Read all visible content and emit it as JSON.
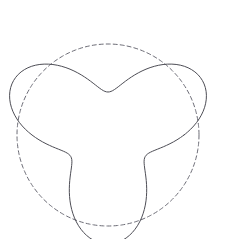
{
  "figure": {
    "title": "",
    "width": 235,
    "height": 239,
    "background_color": "#ffffff"
  },
  "chart_data": {
    "type": "line",
    "title": "",
    "subtitle": "",
    "xlabel": "",
    "ylabel": "",
    "xlim": [
      0,
      235
    ],
    "ylim": [
      0,
      239
    ],
    "grid": false,
    "axes_visible": false,
    "ticks_visible": false,
    "legend": {
      "visible": false,
      "position": "none",
      "entries": []
    },
    "annotations": [],
    "coordinate_system": "polar-on-pixel-canvas",
    "center": {
      "x": 108,
      "y": 135
    },
    "series": [
      {
        "name": "trefoil-curve",
        "style": "solid",
        "color": "#4d4d55",
        "line_width": 1.0,
        "closed": true,
        "equation": "r(theta) = 76 + 33*cos(3*theta + 1.5708)",
        "polar": {
          "mean_radius": 76,
          "amplitude": 33,
          "lobes": 3,
          "phase_degrees": 90,
          "min_radius": 43,
          "max_radius": 109
        },
        "extrema": {
          "lobe_peaks": [
            {
              "label": "top-lobe",
              "x": 93,
              "y": 12
            },
            {
              "label": "right-lobe",
              "x": 222,
              "y": 148
            },
            {
              "label": "left-lobe",
              "x": 8,
              "y": 190
            }
          ],
          "valleys": [
            {
              "label": "upper-left-notch",
              "x": 52,
              "y": 95
            },
            {
              "label": "upper-right-notch",
              "x": 163,
              "y": 98
            },
            {
              "label": "bottom-notch",
              "x": 120,
              "y": 188
            }
          ]
        }
      },
      {
        "name": "reference-circle",
        "style": "dashed",
        "color": "#6b6b75",
        "line_width": 1.0,
        "closed": true,
        "dash_pattern": [
          4,
          3
        ],
        "equation": "r(theta) = 91",
        "circle": {
          "center_x": 108,
          "center_y": 135,
          "radius": 91,
          "leftmost_x": 17,
          "rightmost_x": 199,
          "topmost_y": 44,
          "bottommost_y": 226
        }
      }
    ],
    "intersections": [
      {
        "x": 20,
        "y": 155
      },
      {
        "x": 62,
        "y": 215
      },
      {
        "x": 135,
        "y": 45
      },
      {
        "x": 172,
        "y": 104
      },
      {
        "x": 198,
        "y": 115
      },
      {
        "x": 168,
        "y": 203
      }
    ]
  }
}
